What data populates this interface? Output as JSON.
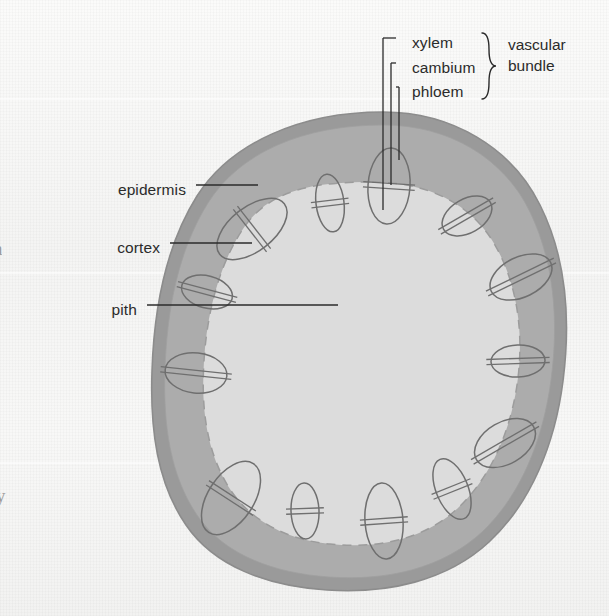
{
  "figure": {
    "kind": "botanical-cross-section-diagram",
    "background_color": "#f5f5f4"
  },
  "labels": {
    "left": [
      {
        "id": "epidermis",
        "text": "epidermis",
        "text_x": 186,
        "text_y": 190,
        "leader": {
          "x1": 196,
          "y1": 185,
          "x2": 258,
          "y2": 185
        }
      },
      {
        "id": "cortex",
        "text": "cortex",
        "text_x": 160,
        "text_y": 248,
        "leader": {
          "x1": 170,
          "y1": 243,
          "x2": 252,
          "y2": 243
        }
      },
      {
        "id": "pith",
        "text": "pith",
        "text_x": 137,
        "text_y": 310,
        "leader": {
          "x1": 147,
          "y1": 305,
          "x2": 338,
          "y2": 305
        }
      }
    ],
    "right": [
      {
        "id": "xylem",
        "text": "xylem",
        "text_x": 412,
        "text_y": 43
      },
      {
        "id": "cambium",
        "text": "cambium",
        "text_x": 412,
        "text_y": 68
      },
      {
        "id": "phloem",
        "text": "phloem",
        "text_x": 412,
        "text_y": 92
      }
    ],
    "group": {
      "id": "vascular-bundle",
      "line1": "vascular",
      "line2": "bundle",
      "text_x": 508,
      "text_y": 47,
      "brace": {
        "x": 489,
        "top": 33,
        "bottom": 99
      }
    }
  },
  "leaders_right": [
    {
      "for": "xylem",
      "hx1": 396,
      "hx2": 383,
      "hy": 38,
      "vy2": 210
    },
    {
      "for": "cambium",
      "hx1": 396,
      "hx2": 391,
      "hy": 63,
      "vy2": 185
    },
    {
      "for": "phloem",
      "hx1": 396,
      "hx2": 399,
      "hy": 87,
      "vy2": 160
    }
  ],
  "colors": {
    "epidermis_fill": "#9a9a9a",
    "epidermis_stroke": "#8c8c8c",
    "cortex_fill": "#acacac",
    "pith_fill": "#dcdcdc",
    "pith_dash_stroke": "#9c9c9c",
    "bundle_stroke": "#6f6f6f",
    "bundle_fill": "none",
    "leader_stroke": "#2b2b2b",
    "text": "#2b2b2b"
  },
  "geometry": {
    "stem_outer_path": "M 383 112 C 452 112 512 148 540 205 C 566 257 571 318 563 381 C 555 444 531 503 489 542 C 447 581 387 594 327 590 C 266 586 214 566 186 525 C 157 483 150 429 152 371 C 154 309 165 247 197 196 C 231 143 300 112 383 112 Z",
    "stem_inner_path": "M 383 125 C 449 125 504 158 530 212 C 554 262 559 320 551 380 C 543 440 521 495 482 532 C 442 569 386 581 329 577 C 272 573 223 554 197 515 C 170 475 163 424 165 369 C 167 310 178 251 208 203 C 240 152 304 125 383 125 Z",
    "pith_path": "M 372 182 C 427 182 471 203 495 245 C 519 287 524 339 517 385 C 510 432 491 477 458 508 C 424 540 376 549 330 544 C 285 540 248 519 228 486 C 206 450 201 406 204 361 C 207 313 219 263 245 226 C 272 188 318 182 372 182 Z",
    "bundles": [
      {
        "id": "b01",
        "cx": 389,
        "cy": 186,
        "rx": 21,
        "ry": 38,
        "rot": 4
      },
      {
        "id": "b02",
        "cx": 330,
        "cy": 203,
        "rx": 14,
        "ry": 29,
        "rot": -7
      },
      {
        "id": "b03",
        "cx": 252,
        "cy": 229,
        "rx": 22,
        "ry": 41,
        "rot": 52
      },
      {
        "id": "b04",
        "cx": 207,
        "cy": 292,
        "rx": 26,
        "ry": 16,
        "rot": 15
      },
      {
        "id": "b05",
        "cx": 196,
        "cy": 373,
        "rx": 31,
        "ry": 20,
        "rot": 6
      },
      {
        "id": "b06",
        "cx": 231,
        "cy": 498,
        "rx": 23,
        "ry": 41,
        "rot": 33
      },
      {
        "id": "b07",
        "cx": 305,
        "cy": 511,
        "rx": 14,
        "ry": 28,
        "rot": -2
      },
      {
        "id": "b08",
        "cx": 384,
        "cy": 521,
        "rx": 19,
        "ry": 38,
        "rot": -4
      },
      {
        "id": "b09",
        "cx": 452,
        "cy": 489,
        "rx": 16,
        "ry": 32,
        "rot": -22
      },
      {
        "id": "b10",
        "cx": 505,
        "cy": 443,
        "rx": 33,
        "ry": 21,
        "rot": -30
      },
      {
        "id": "b11",
        "cx": 518,
        "cy": 361,
        "rx": 27,
        "ry": 16,
        "rot": -2
      },
      {
        "id": "b12",
        "cx": 521,
        "cy": 277,
        "rx": 33,
        "ry": 20,
        "rot": -26
      },
      {
        "id": "b13",
        "cx": 467,
        "cy": 216,
        "rx": 27,
        "ry": 17,
        "rot": -30
      },
      {
        "id": "b14",
        "cx": 312,
        "cy": 330,
        "rx": 0,
        "ry": 0,
        "rot": 0
      }
    ]
  },
  "edge_fragments": [
    {
      "id": "left-mid-fragment",
      "text": "a",
      "x": -6,
      "y": 238
    },
    {
      "id": "left-lower-fragment",
      "text": "y",
      "x": -4,
      "y": 485
    }
  ],
  "scanlines": [
    {
      "y": 98
    },
    {
      "y": 272
    },
    {
      "y": 462
    }
  ]
}
